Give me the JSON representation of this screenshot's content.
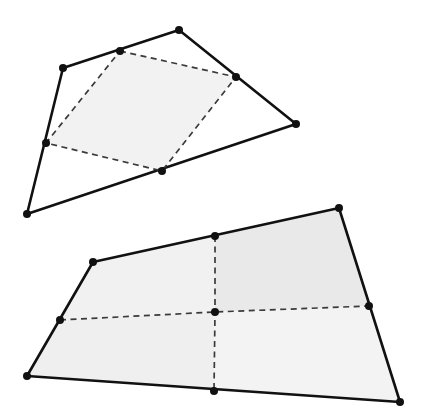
{
  "figure": {
    "background_color": "#ffffff",
    "solid_line_color": "#111111",
    "dashed_line_color": "#3a3a3a",
    "vertex_color": "#111111",
    "shade_color_light": "#f2f2f2",
    "shade_color_mid": "#ececec",
    "solid_line_width": 2.6,
    "dashed_line_width": 1.7,
    "dash_pattern": "6 4.5",
    "vertex_radius": 4.0,
    "canvas": {
      "width": 426,
      "height": 414
    }
  },
  "diagrams": [
    {
      "name": "top-quadrilateral",
      "description": "Convex quadrilateral with its four side midpoints joined by dashed segments, forming a shaded inner Varignon parallelogram.",
      "outer_polygon": {
        "name": "outer-quadrilateral",
        "points": [
          {
            "label": "top-vertex",
            "x": 179,
            "y": 30
          },
          {
            "label": "right-vertex",
            "x": 296,
            "y": 124
          },
          {
            "label": "bottom-left-vertex",
            "x": 27,
            "y": 214
          },
          {
            "label": "left-vertex",
            "x": 63,
            "y": 68
          }
        ]
      },
      "inner_polygon": {
        "name": "inner-varignon-parallelogram",
        "shaded": true,
        "fill": "#f2f2f2",
        "points": [
          {
            "label": "midpoint-top-left-side",
            "x": 120,
            "y": 51
          },
          {
            "label": "midpoint-top-right-side",
            "x": 236,
            "y": 77
          },
          {
            "label": "midpoint-bottom-right-side",
            "x": 162,
            "y": 171
          },
          {
            "label": "midpoint-bottom-left-side",
            "x": 46,
            "y": 143
          }
        ]
      }
    },
    {
      "name": "bottom-quadrilateral",
      "description": "Convex quadrilateral subdivided into four shaded cells by dashed midlines crossing at an interior centre point.",
      "outer_polygon": {
        "name": "outer-quadrilateral",
        "points": [
          {
            "label": "top-left-vertex",
            "x": 93,
            "y": 262
          },
          {
            "label": "top-right-vertex",
            "x": 339,
            "y": 208
          },
          {
            "label": "bottom-right-vertex",
            "x": 400,
            "y": 402
          },
          {
            "label": "bottom-left-vertex",
            "x": 27,
            "y": 376
          }
        ]
      },
      "midpoints": [
        {
          "label": "midpoint-top-side",
          "x": 215,
          "y": 236
        },
        {
          "label": "midpoint-right-side",
          "x": 369,
          "y": 306
        },
        {
          "label": "midpoint-bottom-side",
          "x": 214,
          "y": 391
        },
        {
          "label": "midpoint-left-side",
          "x": 60,
          "y": 320
        }
      ],
      "centre_point": {
        "label": "centre-point",
        "x": 215,
        "y": 312
      },
      "cells": [
        {
          "label": "cell-top-left",
          "fill": "#f1f1f1"
        },
        {
          "label": "cell-top-right",
          "fill": "#e9e9e9"
        },
        {
          "label": "cell-bottom-right",
          "fill": "#f3f3f3"
        },
        {
          "label": "cell-bottom-left",
          "fill": "#efefef"
        }
      ]
    }
  ]
}
